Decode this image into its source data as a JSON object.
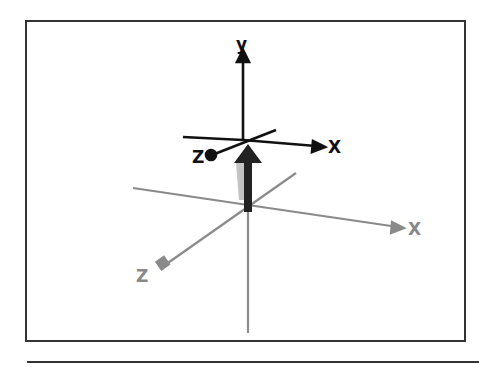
{
  "diagram": {
    "local_axes": {
      "y_label": "y",
      "x_label": "X",
      "z_label": "Z",
      "color": "#111111"
    },
    "world_axes": {
      "x_label": "X",
      "z_label": "Z",
      "color": "#888888"
    },
    "arrow": {
      "direction": "up",
      "color": "#222222"
    }
  }
}
